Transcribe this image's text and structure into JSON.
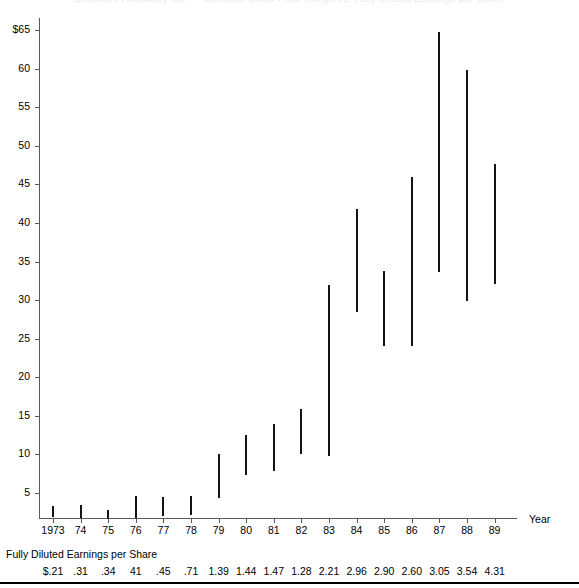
{
  "clipped_title": "Berkshire Hathaway Inc.  —  Common Stock Price Range vs. Fully Diluted Earnings per Share",
  "axes": {
    "x_title": "Year",
    "y_tick_labels": [
      "$65",
      "60",
      "55",
      "50",
      "45",
      "40",
      "35",
      "30",
      "25",
      "20",
      "15",
      "10",
      "5"
    ],
    "y_tick_values": [
      65,
      60,
      55,
      50,
      45,
      40,
      35,
      30,
      25,
      20,
      15,
      10,
      5
    ]
  },
  "eps_caption": "Fully Diluted Earnings per Share",
  "chart_data": {
    "type": "bar",
    "subtype": "floating-range-bar",
    "title": "",
    "xlabel": "Year",
    "ylabel": "",
    "ylim": [
      1.6,
      66.0
    ],
    "grid": false,
    "legend": null,
    "categories": [
      "1973",
      "74",
      "75",
      "76",
      "77",
      "78",
      "79",
      "80",
      "81",
      "82",
      "83",
      "84",
      "85",
      "86",
      "87",
      "88",
      "89"
    ],
    "eps_labels": [
      "$.21",
      ".31",
      ".34",
      "41",
      ".45",
      ".71",
      "1.39",
      "1.44",
      "1.47",
      "1.28",
      "2.21",
      "2.96",
      "2.90",
      "2.60",
      "3.05",
      "3.54",
      "4.31"
    ],
    "eps_values": [
      0.21,
      0.31,
      0.34,
      0.41,
      0.45,
      0.71,
      1.39,
      1.44,
      1.47,
      1.28,
      2.21,
      2.96,
      2.9,
      2.6,
      3.05,
      3.54,
      4.31
    ],
    "series": [
      {
        "name": "High",
        "values": [
          3.3,
          3.4,
          2.8,
          4.6,
          4.5,
          4.6,
          10.0,
          12.5,
          14.0,
          15.9,
          32.0,
          41.8,
          33.8,
          45.9,
          64.8,
          59.8,
          47.6
        ]
      },
      {
        "name": "Low",
        "values": [
          1.9,
          1.7,
          1.7,
          1.8,
          2.0,
          2.2,
          4.4,
          7.3,
          7.8,
          10.0,
          9.8,
          28.5,
          24.1,
          24.1,
          33.6,
          29.9,
          32.1
        ]
      }
    ]
  }
}
